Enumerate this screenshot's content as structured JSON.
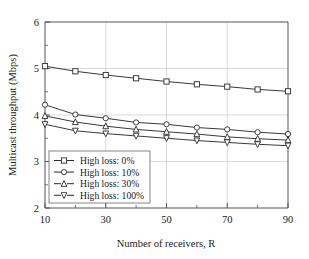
{
  "chart_data": {
    "type": "line",
    "title": "",
    "xlabel": "Number of receivers, R",
    "ylabel": "Multicast throughput (Mbps)",
    "x": [
      10,
      20,
      30,
      40,
      50,
      60,
      70,
      80,
      90
    ],
    "xlim": [
      10,
      90
    ],
    "ylim": [
      2,
      6
    ],
    "xticks": [
      10,
      20,
      30,
      40,
      50,
      60,
      70,
      80,
      90
    ],
    "xtick_labels": [
      "10",
      "",
      "30",
      "",
      "50",
      "",
      "70",
      "",
      "90"
    ],
    "yticks": [
      2,
      2.5,
      3,
      3.5,
      4,
      4.5,
      5,
      5.5,
      6
    ],
    "ytick_labels": [
      "2",
      "",
      "3",
      "",
      "4",
      "",
      "5",
      "",
      "6"
    ],
    "grid": true,
    "grid_axes": "both-major",
    "legend_position": "lower-left-inside",
    "series": [
      {
        "name": "High loss: 0%",
        "marker": "square",
        "values": [
          5.05,
          4.94,
          4.86,
          4.79,
          4.72,
          4.66,
          4.61,
          4.55,
          4.51
        ]
      },
      {
        "name": "High loss: 10%",
        "marker": "circle",
        "values": [
          4.22,
          4.01,
          3.93,
          3.84,
          3.8,
          3.73,
          3.69,
          3.63,
          3.59
        ]
      },
      {
        "name": "High loss: 30%",
        "marker": "triangle-up",
        "values": [
          3.98,
          3.85,
          3.76,
          3.69,
          3.64,
          3.59,
          3.53,
          3.49,
          3.46
        ]
      },
      {
        "name": "High loss: 100%",
        "marker": "triangle-down",
        "values": [
          3.8,
          3.66,
          3.6,
          3.55,
          3.5,
          3.45,
          3.41,
          3.37,
          3.34
        ]
      }
    ]
  },
  "legend": {
    "entries": [
      {
        "label": "High loss: 0%"
      },
      {
        "label": "High loss: 10%"
      },
      {
        "label": "High loss: 30%"
      },
      {
        "label": "High loss: 100%"
      }
    ]
  },
  "axes": {
    "x_title": "Number of receivers, R",
    "y_title": "Multicast throughput (Mbps)",
    "x_labels": [
      "10",
      "30",
      "50",
      "70",
      "90"
    ],
    "y_labels": [
      "2",
      "3",
      "4",
      "5",
      "6"
    ]
  },
  "colors": {
    "line": "#3a3a3a",
    "marker_fill": "#ffffff",
    "marker_stroke": "#2b2b2b",
    "grid": "#cccccc",
    "axis": "#555555",
    "background": "#ffffff",
    "text": "#1a1a1a"
  }
}
